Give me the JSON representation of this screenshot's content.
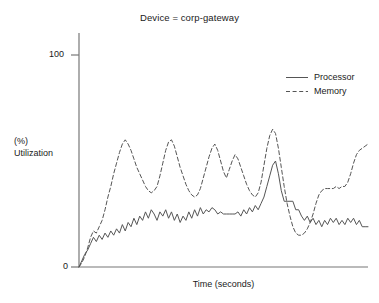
{
  "chart_data": {
    "type": "line",
    "title": "Device = corp-gateway",
    "xlabel": "Time (seconds)",
    "ylabel": "(%) Utilization",
    "ylabel_line1": "(%)",
    "ylabel_line2": "Utilization",
    "grid": false,
    "legend_position": "upper right",
    "xlim": [
      0,
      100
    ],
    "ylim": [
      0,
      100
    ],
    "yticks": [
      0,
      100
    ],
    "ytick_labels": [
      "0",
      "100"
    ],
    "xticks": [],
    "xtick_labels": [],
    "line_color": "#555555",
    "axis_color": "#777777",
    "background": "#ffffff",
    "x": [
      0,
      1,
      2,
      3,
      4,
      5,
      6,
      7,
      8,
      9,
      10,
      11,
      12,
      13,
      14,
      15,
      16,
      17,
      18,
      19,
      20,
      21,
      22,
      23,
      24,
      25,
      26,
      27,
      28,
      29,
      30,
      31,
      32,
      33,
      34,
      35,
      36,
      37,
      38,
      39,
      40,
      41,
      42,
      43,
      44,
      45,
      46,
      47,
      48,
      49,
      50,
      51,
      52,
      53,
      54,
      55,
      56,
      57,
      58,
      59,
      60,
      61,
      62,
      63,
      64,
      65,
      66,
      67,
      68,
      69,
      70,
      71,
      72,
      73,
      74,
      75,
      76,
      77,
      78,
      79,
      80,
      81,
      82,
      83,
      84,
      85,
      86,
      87,
      88,
      89,
      90,
      91,
      92,
      93,
      94,
      95,
      96,
      97,
      98,
      99,
      100
    ],
    "series": [
      {
        "name": "Processor",
        "style": "solid",
        "values": [
          0,
          3,
          6,
          8,
          11,
          14,
          12,
          15,
          13,
          16,
          14,
          17,
          15,
          18,
          16,
          20,
          17,
          21,
          19,
          23,
          20,
          24,
          22,
          26,
          23,
          27,
          25,
          22,
          26,
          24,
          27,
          23,
          26,
          22,
          25,
          21,
          24,
          22,
          26,
          23,
          27,
          24,
          28,
          25,
          27,
          26,
          28,
          27,
          25,
          26,
          25,
          25,
          25,
          25,
          25,
          26,
          24,
          27,
          25,
          28,
          26,
          29,
          27,
          30,
          33,
          38,
          43,
          48,
          50,
          44,
          36,
          31,
          31,
          31,
          31,
          27,
          27,
          24,
          22,
          24,
          21,
          23,
          20,
          22,
          19,
          22,
          20,
          23,
          21,
          23,
          20,
          22,
          20,
          23,
          21,
          23,
          20,
          22,
          19,
          19,
          19
        ]
      },
      {
        "name": "Memory",
        "style": "dashed",
        "values": [
          0,
          2,
          5,
          9,
          14,
          17,
          16,
          19,
          22,
          27,
          33,
          38,
          44,
          49,
          54,
          58,
          60,
          58,
          55,
          51,
          47,
          44,
          41,
          38,
          36,
          35,
          36,
          38,
          43,
          49,
          55,
          59,
          60,
          57,
          52,
          47,
          43,
          39,
          36,
          34,
          33,
          34,
          37,
          42,
          47,
          52,
          56,
          58,
          55,
          50,
          45,
          42,
          46,
          50,
          53,
          51,
          47,
          43,
          39,
          36,
          34,
          33,
          35,
          40,
          48,
          56,
          62,
          65,
          63,
          56,
          47,
          38,
          30,
          24,
          19,
          16,
          15,
          15,
          16,
          18,
          21,
          25,
          30,
          34,
          36,
          37,
          37,
          37,
          37,
          38,
          37,
          38,
          38,
          40,
          44,
          49,
          53,
          55,
          56,
          57,
          58
        ]
      }
    ]
  },
  "legend": {
    "items": [
      {
        "label": "Processor",
        "style": "solid"
      },
      {
        "label": "Memory",
        "style": "dashed"
      }
    ]
  }
}
